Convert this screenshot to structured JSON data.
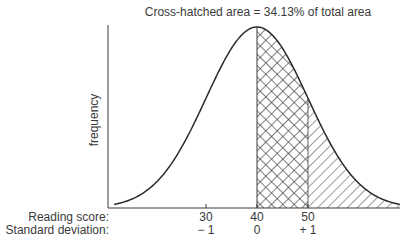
{
  "chart_data": {
    "type": "area",
    "title": "Cross-hatched area = 34.13% of total area",
    "ylabel": "frequency",
    "xlabel": "",
    "distribution": "normal",
    "mean": 40,
    "sd": 10,
    "x_range_sd": [
      -2.8,
      2.8
    ],
    "ticks": [
      {
        "score": "30",
        "sd": "− 1",
        "value": 30
      },
      {
        "score": "40",
        "sd": "0",
        "value": 40
      },
      {
        "score": "50",
        "sd": "+ 1",
        "value": 50
      }
    ],
    "row_labels": {
      "score": "Reading score:",
      "sd": "Standard deviation:"
    },
    "regions": [
      {
        "name": "cross-hatched",
        "from_sd": 0,
        "to_sd": 1,
        "percent_of_total": 34.13
      },
      {
        "name": "single-hatched",
        "from_sd": 1,
        "to_sd": 2.8
      }
    ],
    "grid": false,
    "legend": "none"
  },
  "colors": {
    "ink": "#3a3a3a",
    "background": "#ffffff"
  }
}
